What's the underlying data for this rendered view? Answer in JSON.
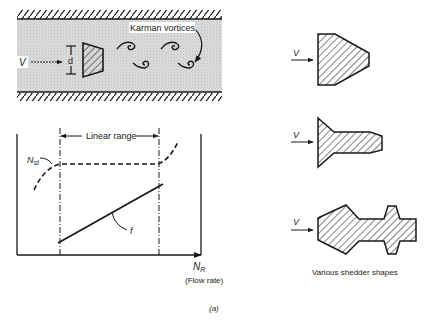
{
  "figure": {
    "caption": "(a)",
    "colors": {
      "ink": "#1a1a1a",
      "pipe_fill": "#d4d4d4",
      "background": "#ffffff"
    }
  },
  "flow_diagram": {
    "velocity_label": "V",
    "diameter_label": "d",
    "vortices_label": "Karman vortices"
  },
  "graph": {
    "range_label": "Linear range",
    "strouhal_label": "N",
    "strouhal_sub": "st",
    "frequency_label": "f",
    "x_axis_label": "N",
    "x_axis_sub": "R",
    "x_axis_desc": "(Flow rate)"
  },
  "shedders": {
    "title": "Various shedder shapes",
    "shapes": [
      {
        "name": "trapezoidal-shedder",
        "velocity_label": "V"
      },
      {
        "name": "t-shaped-shedder",
        "velocity_label": "V"
      },
      {
        "name": "complex-shedder",
        "velocity_label": "V"
      }
    ]
  }
}
